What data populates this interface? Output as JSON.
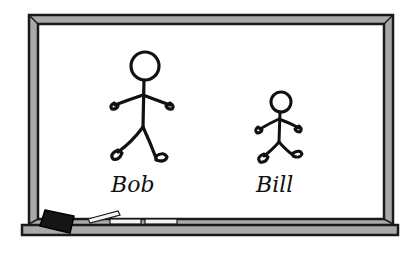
{
  "scene": {
    "description": "Chalkboard with two stick figures",
    "colors": {
      "frame": "#a9a9a9",
      "frame_outline": "#1a1a1a",
      "board": "#ffffff",
      "ink": "#111111",
      "eraser": "#151515",
      "chalk": "#f4f4f4"
    }
  },
  "figures": [
    {
      "name": "Bob",
      "label": "Bob",
      "size": "large"
    },
    {
      "name": "Bill",
      "label": "Bill",
      "size": "small"
    }
  ],
  "tray_items": [
    {
      "type": "eraser"
    },
    {
      "type": "chalk",
      "orientation": "tilted"
    },
    {
      "type": "chalk",
      "orientation": "flat"
    },
    {
      "type": "chalk",
      "orientation": "flat"
    }
  ]
}
